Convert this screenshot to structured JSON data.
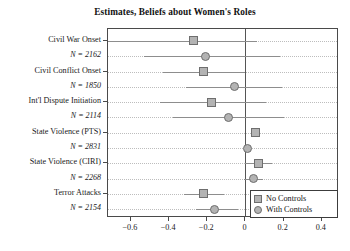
{
  "chart_data": {
    "type": "scatter",
    "title": "Estimates, Beliefs about Women's Roles",
    "xlabel": "",
    "ylabel": "",
    "xlim": [
      -0.72,
      0.49
    ],
    "xticks": [
      -0.6,
      -0.4,
      -0.2,
      0,
      0.2,
      0.4
    ],
    "xticklabels": [
      "−0.6",
      "−0.4",
      "−0.2",
      "0",
      "0.2",
      "0.4"
    ],
    "grid": "horizontal-dotted",
    "zero_reference_line": 0,
    "legend_position": "bottom-right",
    "legend": [
      {
        "name": "No Controls",
        "marker": "square",
        "color": "#b3b3b3"
      },
      {
        "name": "With Controls",
        "marker": "circle",
        "color": "#b3b3b3"
      }
    ],
    "outcomes": [
      {
        "label": "Civil War Onset",
        "n_label": "N = 2162",
        "no_controls": {
          "estimate": -0.27,
          "ci_low": -0.72,
          "ci_high": 0.06
        },
        "with_controls": {
          "estimate": -0.21,
          "ci_low": -0.53,
          "ci_high": 0.18
        }
      },
      {
        "label": "Civil Conflict Onset",
        "n_label": "N = 1850",
        "no_controls": {
          "estimate": -0.22,
          "ci_low": -0.43,
          "ci_high": 0.0
        },
        "with_controls": {
          "estimate": -0.06,
          "ci_low": -0.31,
          "ci_high": 0.19
        }
      },
      {
        "label": "Int'l Dispute Initiation",
        "n_label": "N = 2114",
        "no_controls": {
          "estimate": -0.18,
          "ci_low": -0.45,
          "ci_high": 0.11
        },
        "with_controls": {
          "estimate": -0.09,
          "ci_low": -0.38,
          "ci_high": 0.2
        }
      },
      {
        "label": "State Violence (PTS)",
        "n_label": "N = 2831",
        "no_controls": {
          "estimate": 0.05,
          "ci_low": 0.04,
          "ci_high": 0.06
        },
        "with_controls": {
          "estimate": 0.01,
          "ci_low": 0.0,
          "ci_high": 0.02
        }
      },
      {
        "label": "State Violence (CIRI)",
        "n_label": "N = 2268",
        "no_controls": {
          "estimate": 0.07,
          "ci_low": 0.0,
          "ci_high": 0.14
        },
        "with_controls": {
          "estimate": 0.04,
          "ci_low": -0.01,
          "ci_high": 0.09
        }
      },
      {
        "label": "Terror Attacks",
        "n_label": "N = 2154",
        "no_controls": {
          "estimate": -0.22,
          "ci_low": -0.32,
          "ci_high": -0.11
        },
        "with_controls": {
          "estimate": -0.16,
          "ci_low": -0.26,
          "ci_high": -0.04
        }
      }
    ]
  }
}
